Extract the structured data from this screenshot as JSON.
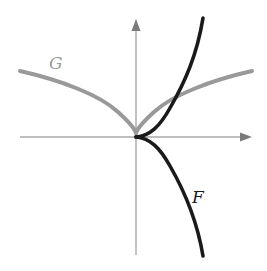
{
  "figure": {
    "type": "function-graphs",
    "axes": {
      "x_axis": {
        "arrow": "right",
        "color": "#a8a8a8"
      },
      "y_axis": {
        "arrow": "up",
        "color": "#a8a8a8"
      },
      "ticks": false,
      "tick_labels": []
    },
    "curves": [
      {
        "name": "G",
        "label": "G",
        "color": "#999999",
        "shape": "cusp at origin opening upward, symmetric, concave down on both sides (like y = |x|^(2/3))"
      },
      {
        "name": "F",
        "label": "F",
        "color": "#1a1a1a",
        "shape": "semicubical cusp at origin pointing left, upper branch rising steeply to the right, lower branch falling steeply to the right (like y^2 = x^3)"
      }
    ],
    "intersections": [
      {
        "curves": [
          "F",
          "G"
        ],
        "description": "upper branch of F crosses right branch of G in first quadrant"
      }
    ]
  }
}
